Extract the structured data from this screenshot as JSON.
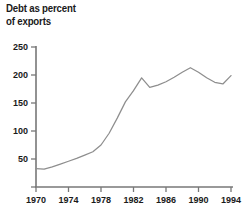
{
  "title": {
    "line1": "Debt as percent",
    "line2": "of exports"
  },
  "chart_data": {
    "type": "line",
    "title": "Debt as percent of exports",
    "xlabel": "",
    "ylabel": "",
    "xlim": [
      1970,
      1994
    ],
    "ylim": [
      0,
      250
    ],
    "grid": false,
    "legend": null,
    "xticks": [
      1970,
      1974,
      1978,
      1982,
      1986,
      1990,
      1994
    ],
    "xtick_labels": [
      "1970",
      "1974",
      "1978",
      "1982",
      "1986",
      "1990",
      "1994"
    ],
    "yticks": [
      0,
      50,
      100,
      150,
      200,
      250
    ],
    "ytick_labels": [
      "",
      "50",
      "100",
      "150",
      "200",
      "250"
    ],
    "x": [
      1970,
      1971,
      1972,
      1973,
      1974,
      1975,
      1976,
      1977,
      1978,
      1979,
      1980,
      1981,
      1982,
      1983,
      1984,
      1985,
      1986,
      1987,
      1988,
      1989,
      1990,
      1991,
      1992,
      1993,
      1994
    ],
    "values": [
      33,
      32,
      36,
      41,
      46,
      51,
      57,
      63,
      75,
      96,
      123,
      152,
      172,
      195,
      178,
      182,
      188,
      196,
      205,
      213,
      205,
      195,
      187,
      184,
      199
    ],
    "series": [
      {
        "name": "Debt as percent of exports",
        "color": "#8e8e8e",
        "values": [
          33,
          32,
          36,
          41,
          46,
          51,
          57,
          63,
          75,
          96,
          123,
          152,
          172,
          195,
          178,
          182,
          188,
          196,
          205,
          213,
          205,
          195,
          187,
          184,
          199
        ]
      }
    ],
    "annotations": []
  },
  "colors": {
    "line": "#8e8e8e",
    "axis": "#777777",
    "text": "#1a1a1a",
    "background": "#ffffff"
  }
}
